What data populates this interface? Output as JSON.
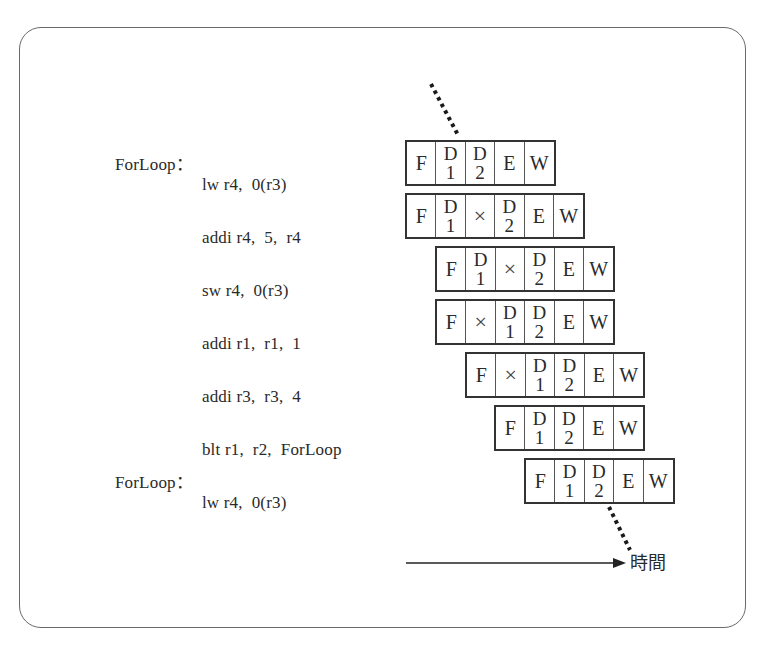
{
  "diagram": {
    "type": "pipeline-timing-diagram",
    "instructions": [
      {
        "label": "ForLoop：",
        "text": "lw r4,  0(r3)",
        "stages": [
          "F",
          "D|1",
          "D|2",
          "E",
          "W"
        ]
      },
      {
        "label": "",
        "text": "addi r4,  5,  r4",
        "stages": [
          "F",
          "D|1",
          "×",
          "D|2",
          "E",
          "W"
        ]
      },
      {
        "label": "",
        "text": "sw r4,  0(r3)",
        "stages": [
          "F",
          "D|1",
          "×",
          "D|2",
          "E",
          "W"
        ]
      },
      {
        "label": "",
        "text": "addi r1,  r1,  1",
        "stages": [
          "F",
          "×",
          "D|1",
          "D|2",
          "E",
          "W"
        ]
      },
      {
        "label": "",
        "text": "addi r3,  r3,  4",
        "stages": [
          "F",
          "×",
          "D|1",
          "D|2",
          "E",
          "W"
        ]
      },
      {
        "label": "",
        "text": "blt r1,  r2,  ForLoop",
        "stages": [
          "F",
          "D|1",
          "D|2",
          "E",
          "W"
        ]
      },
      {
        "label": "ForLoop：",
        "text": "lw r4,  0(r3)",
        "stages": [
          "F",
          "D|1",
          "D|2",
          "E",
          "W"
        ]
      }
    ],
    "stage_legend": {
      "F": "Fetch",
      "D1": "Decode 1",
      "D2": "Decode 2",
      "E": "Execute",
      "W": "Write-back",
      "×": "stall"
    },
    "time_axis": {
      "label": "時間"
    },
    "colors": {
      "line": "#333333",
      "text": "#2a2a2a",
      "frame": "#6a6a6a"
    }
  },
  "text": {
    "row0_label": "ForLoop：",
    "row0_instr": "lw r4,  0(r3)",
    "row1_instr": "addi r4,  5,  r4",
    "row2_instr": "sw r4,  0(r3)",
    "row3_instr": "addi r1,  r1,  1",
    "row4_instr": "addi r3,  r3,  4",
    "row5_instr": "blt r1,  r2,  ForLoop",
    "row6_label": "ForLoop：",
    "row6_instr": "lw r4,  0(r3)",
    "time_label": "時間",
    "stage_F": "F",
    "stage_D": "D",
    "stage_E": "E",
    "stage_W": "W",
    "stall": "×",
    "one": "1",
    "two": "2"
  }
}
